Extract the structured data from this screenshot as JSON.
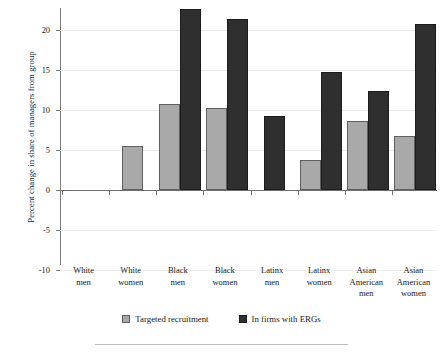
{
  "chart_data": {
    "type": "bar",
    "title": "",
    "subtitle": "",
    "xlabel": "",
    "ylabel": "Percent change in share of managers from group",
    "ylim": [
      -10,
      22.5
    ],
    "yticks": [
      -10,
      -5,
      0,
      5,
      10,
      15,
      20
    ],
    "ytick_labels": [
      "-10",
      "-5",
      "0",
      "5",
      "10",
      "15",
      "20"
    ],
    "grid": true,
    "grid_axis": "y",
    "legend_position": "bottom",
    "categories": [
      "White men",
      "White women",
      "Black men",
      "Black women",
      "Latinx men",
      "Latinx women",
      "Asian American men",
      "Asian American women"
    ],
    "category_lines": [
      [
        "White",
        "men"
      ],
      [
        "White",
        "women"
      ],
      [
        "Black",
        "men"
      ],
      [
        "Black",
        "women"
      ],
      [
        "Latinx",
        "men"
      ],
      [
        "Latinx",
        "women"
      ],
      [
        "Asian",
        "American",
        "men"
      ],
      [
        "Asian",
        "American",
        "women"
      ]
    ],
    "series": [
      {
        "name": "Targeted recruitment",
        "color": "#a9a9a9",
        "edge_color": "#5f5f5f",
        "values": [
          null,
          5.5,
          10.8,
          10.2,
          null,
          3.7,
          8.6,
          6.7
        ]
      },
      {
        "name": "In firms with ERGs",
        "color": "#2f2f2f",
        "edge_color": "#1c1c1c",
        "values": [
          null,
          null,
          22.6,
          21.4,
          9.3,
          14.7,
          12.4,
          20.7
        ]
      }
    ]
  },
  "legend": {
    "items": [
      {
        "label": "Targeted recruitment",
        "swatch": "s0"
      },
      {
        "label": "In firms with ERGs",
        "swatch": "s1"
      }
    ]
  }
}
